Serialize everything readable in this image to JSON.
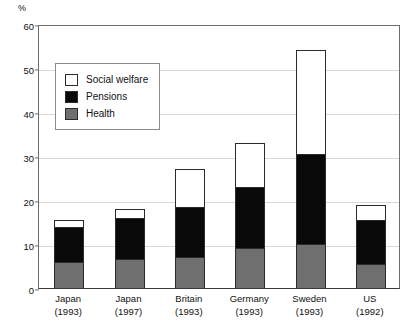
{
  "axis": {
    "unit_label": "%",
    "y_ticks": [
      0,
      10,
      20,
      30,
      40,
      50,
      60
    ]
  },
  "legend": {
    "items": [
      {
        "label": "Social welfare",
        "key": "welfare",
        "color": "#ffffff",
        "icon": "square-swatch-icon"
      },
      {
        "label": "Pensions",
        "key": "pensions",
        "color": "#090909",
        "icon": "square-swatch-icon"
      },
      {
        "label": "Health",
        "key": "health",
        "color": "#6f6f6f",
        "icon": "square-swatch-icon"
      }
    ]
  },
  "categories": [
    {
      "name": "Japan",
      "year": "(1993)"
    },
    {
      "name": "Japan",
      "year": "(1997)"
    },
    {
      "name": "Britain",
      "year": "(1993)"
    },
    {
      "name": "Germany",
      "year": "(1993)"
    },
    {
      "name": "Sweden",
      "year": "(1993)"
    },
    {
      "name": "US",
      "year": "(1992)"
    }
  ],
  "chart_data": {
    "type": "bar",
    "stacked": true,
    "title": "",
    "subtitle": "",
    "xlabel": "",
    "ylabel": "%",
    "ylim": [
      0,
      60
    ],
    "yticks": [
      0,
      10,
      20,
      30,
      40,
      50,
      60
    ],
    "grid": true,
    "legend_position": "inside-top-left",
    "categories": [
      "Japan (1993)",
      "Japan (1997)",
      "Britain (1993)",
      "Germany (1993)",
      "Sweden (1993)",
      "US (1992)"
    ],
    "series": [
      {
        "name": "Health",
        "color": "#6f6f6f",
        "values": [
          6.0,
          6.5,
          7.0,
          9.0,
          10.0,
          5.5
        ]
      },
      {
        "name": "Pensions",
        "color": "#090909",
        "values": [
          8.0,
          9.5,
          11.5,
          14.0,
          20.5,
          10.0
        ]
      },
      {
        "name": "Social welfare",
        "color": "#ffffff",
        "values": [
          1.5,
          2.0,
          8.5,
          10.0,
          23.5,
          3.3
        ]
      }
    ],
    "totals": [
      15.5,
      18.0,
      27.0,
      33.0,
      54.0,
      18.8
    ]
  }
}
